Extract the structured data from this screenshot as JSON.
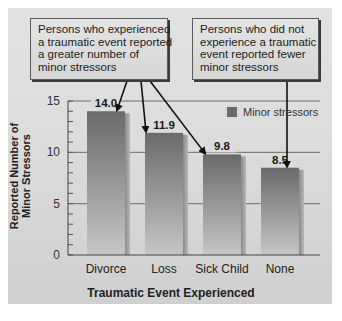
{
  "chart_data": {
    "type": "bar",
    "title": "",
    "xlabel": "Traumatic Event Experienced",
    "ylabel": "Reported Number of Minor Stressors",
    "categories": [
      "Divorce",
      "Loss",
      "Sick Child",
      "None"
    ],
    "series": [
      {
        "name": "Minor stressors",
        "values": [
          14.0,
          11.9,
          9.8,
          8.5
        ]
      }
    ],
    "value_labels": [
      "14.0",
      "11.9",
      "9.8",
      "8.5"
    ],
    "ylim": [
      0,
      15
    ],
    "yticks": [
      0,
      5,
      10,
      15
    ],
    "minor_tick_step": 1,
    "grid": true,
    "legend_position": "top-right inside plot",
    "annotations": [
      {
        "text": "Persons who experienced a traumatic event reported a greater number of minor stressors",
        "points_to": [
          "Divorce",
          "Loss",
          "Sick Child"
        ]
      },
      {
        "text": "Persons who did not experience a traumatic event reported fewer minor stressors",
        "points_to": [
          "None"
        ]
      }
    ]
  },
  "callouts": {
    "left": {
      "lines": [
        "Persons who experienced",
        "a traumatic event reported",
        "a greater number of",
        "minor stressors"
      ]
    },
    "right": {
      "lines": [
        "Persons who did not",
        "experience a traumatic",
        "event reported fewer",
        "minor stressors"
      ]
    }
  },
  "axis": {
    "ylabel_line1": "Reported Number of",
    "ylabel_line2": "Minor Stressors",
    "xlabel": "Traumatic Event Experienced",
    "ytick_labels": [
      "0",
      "5",
      "10",
      "15"
    ]
  },
  "legend": {
    "label": "Minor stressors",
    "color": "#6b6b6b"
  },
  "colors": {
    "bar_top": "#6a6a6a",
    "bar_bottom": "#c4c4c4",
    "bar_shadow": "#7d7d7d",
    "background": "#dcdcdc"
  }
}
